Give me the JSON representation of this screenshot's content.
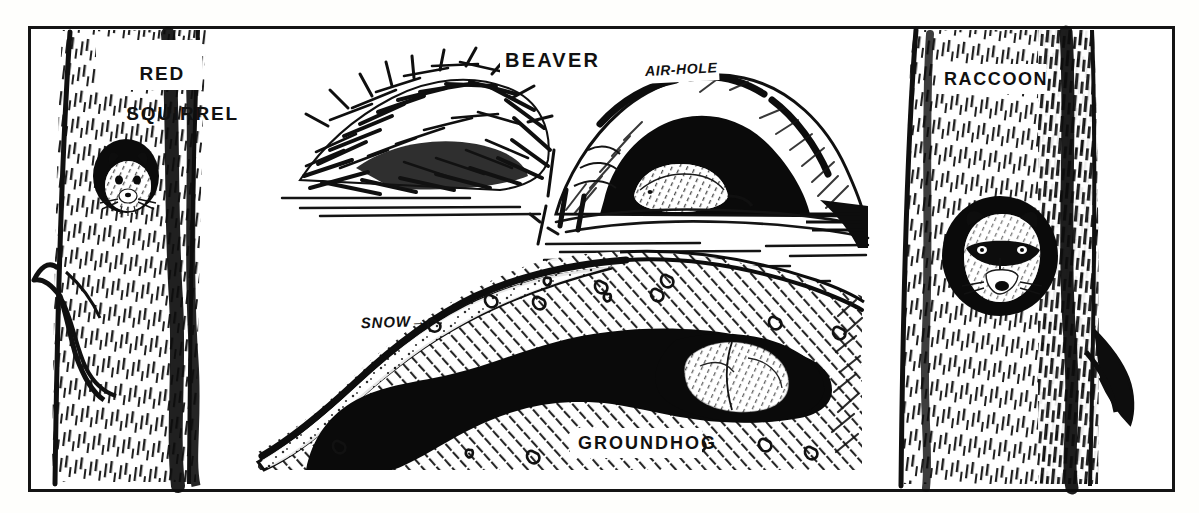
{
  "figure": {
    "style": "black-and-white pen-and-ink line drawing",
    "frame": {
      "border_color": "#141414",
      "background": "#ffffff"
    },
    "ink_color": "#111111"
  },
  "labels": {
    "red_squirrel_line1": "RED",
    "red_squirrel_line2": "SQUIRREL",
    "beaver": "BEAVER",
    "air_hole": "AIR-HOLE",
    "snow": "SNOW",
    "snow_arrow": "→",
    "groundhog": "GROUNDHOG",
    "raccoon": "RACCOON"
  },
  "panels": [
    {
      "name": "red-squirrel-panel",
      "label": "RED SQUIRREL",
      "subject": "red squirrel peering from a hole in a tree trunk",
      "position": "left"
    },
    {
      "name": "beaver-panel",
      "label": "BEAVER",
      "subject": "beaver lodge of sticks beside a snow-covered bank lodge with air-hole, cutaway showing beaver inside, water below",
      "callouts": [
        "AIR-HOLE"
      ],
      "position": "top-center"
    },
    {
      "name": "groundhog-panel",
      "label": "GROUNDHOG",
      "subject": "cutaway of a groundhog burrow beneath snow, animal curled asleep in the chamber",
      "callouts": [
        "SNOW"
      ],
      "position": "bottom-center"
    },
    {
      "name": "raccoon-panel",
      "label": "RACCOON",
      "subject": "raccoon looking out of a hollow in a tree trunk",
      "position": "right"
    }
  ]
}
